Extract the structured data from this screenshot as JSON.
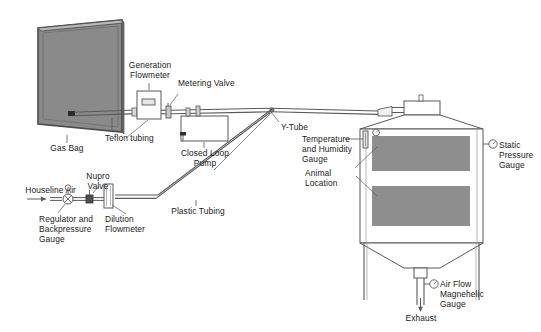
{
  "diagram": {
    "colors": {
      "line": "#59595b",
      "line_dark": "#3b3b3d",
      "fill_gray": "#8e8e8e",
      "bag_fill": "#8a8a8a",
      "bag_edge": "#4a4a4a",
      "text": "#1a1a1a",
      "white": "#ffffff"
    },
    "labels": {
      "gas_bag": "Gas Bag",
      "teflon_tubing": "Teflon tubing",
      "generation_flowmeter_line1": "Generation",
      "generation_flowmeter_line2": "Flowmeter",
      "metering_valve": "Metering Valve",
      "closed_loop_pump_line1": "Closed Loop",
      "closed_loop_pump_line2": "Pump",
      "y_tube": "Y-Tube",
      "temp_humidity_line1": "Temperature",
      "temp_humidity_line2": "and Humidity",
      "temp_humidity_line3": "Gauge",
      "animal_location_line1": "Animal",
      "animal_location_line2": "Location",
      "static_pressure_line1": "Static",
      "static_pressure_line2": "Pressure",
      "static_pressure_line3": "Gauge",
      "houseline_air": "Houseline Air",
      "nupro_valve_line1": "Nupro",
      "nupro_valve_line2": "Valve",
      "regulator_line1": "Regulator and",
      "regulator_line2": "Backpressure",
      "regulator_line3": "Gauge",
      "dilution_flowmeter_line1": "Dilution",
      "dilution_flowmeter_line2": "Flowmeter",
      "plastic_tubing": "Plastic Tubing",
      "air_flow_line1": "Air Flow",
      "air_flow_line2": "Magnehelic",
      "air_flow_line3": "Gauge",
      "exhaust": "Exhaust"
    },
    "icons": {
      "gas_bag": "gas-bag-icon",
      "generation_flowmeter": "flowmeter-icon",
      "metering_valve": "valve-icon",
      "closed_loop_pump": "pump-icon",
      "y_tube": "y-junction-icon",
      "chamber": "exposure-chamber-icon",
      "temperature_gauge": "thermometer-icon",
      "humidity_gauge": "dial-gauge-icon",
      "static_pressure_gauge": "dial-gauge-icon",
      "airflow_gauge": "dial-gauge-icon",
      "regulator_gauge": "regulator-gauge-icon",
      "nupro_valve": "valve-icon",
      "dilution_flowmeter": "flowmeter-icon",
      "houseline_arrow": "arrow-right-icon",
      "exhaust_arrow": "arrow-down-icon",
      "animal_shelf_top": "animal-shelf-icon",
      "animal_shelf_bottom": "animal-shelf-icon"
    }
  }
}
